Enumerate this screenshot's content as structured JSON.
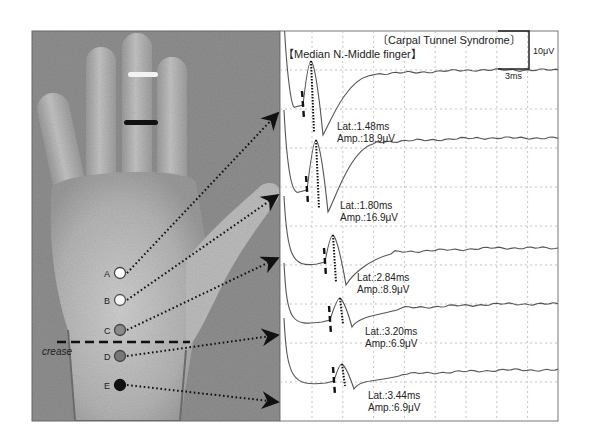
{
  "figure": {
    "title": "〔Carpal Tunnel Syndrome〕",
    "subtitle": "【Median N.-Middle finger】",
    "scale_bar": {
      "amplitude_label": "10μV",
      "time_label": "3ms"
    },
    "crease_label": "crease",
    "colors": {
      "background_photo": "#8e8e8e",
      "trace": "#555555",
      "grid": "#b5b5b5",
      "text": "#222222",
      "ring_white": "#f2f2f2",
      "ring_black": "#111111"
    }
  },
  "stimulation_points": [
    {
      "label": "A",
      "fill": "#ffffff",
      "stroke": "#444444",
      "cx": 120,
      "cy": 273,
      "arrow_to_y": 113
    },
    {
      "label": "B",
      "fill": "#f4f4f4",
      "stroke": "#555555",
      "cx": 120,
      "cy": 300,
      "arrow_to_y": 195
    },
    {
      "label": "C",
      "fill": "#8a8a8a",
      "stroke": "#444444",
      "cx": 120,
      "cy": 330,
      "arrow_to_y": 258
    },
    {
      "label": "D",
      "fill": "#777777",
      "stroke": "#444444",
      "cx": 120,
      "cy": 356,
      "arrow_to_y": 335
    },
    {
      "label": "E",
      "fill": "#111111",
      "stroke": "#111111",
      "cx": 120,
      "cy": 385,
      "arrow_to_y": 402
    }
  ],
  "chart_data": {
    "type": "line",
    "title": "〔Carpal Tunnel Syndrome〕 【Median N.-Middle finger】",
    "xlabel": "time (3 ms per division)",
    "ylabel": "amplitude (10 μV per division)",
    "grid": true,
    "legend": "none",
    "scale": {
      "x_per_div_ms": 3,
      "y_per_div_uV": 10
    },
    "series": [
      {
        "name": "A",
        "latency_ms": 1.48,
        "amplitude_uV": 18.9,
        "label_lat": "Lat.:1.48ms",
        "label_amp": "Amp.:18.9μV"
      },
      {
        "name": "B",
        "latency_ms": 1.8,
        "amplitude_uV": 16.9,
        "label_lat": "Lat.:1.80ms",
        "label_amp": "Amp.:16.9μV"
      },
      {
        "name": "C",
        "latency_ms": 2.84,
        "amplitude_uV": 8.9,
        "label_lat": "Lat.:2.84ms",
        "label_amp": "Amp.:8.9μV"
      },
      {
        "name": "D",
        "latency_ms": 3.2,
        "amplitude_uV": 6.9,
        "label_lat": "Lat.:3.20ms",
        "label_amp": "Amp.:6.9μV"
      },
      {
        "name": "E",
        "latency_ms": 3.44,
        "amplitude_uV": 6.9,
        "label_lat": "Lat.:3.44ms",
        "label_amp": "Amp.:6.9μV"
      }
    ]
  }
}
